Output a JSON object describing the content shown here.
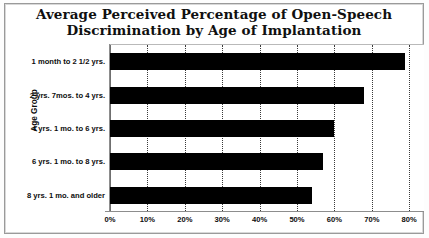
{
  "chart_data": {
    "type": "bar",
    "orientation": "horizontal",
    "title": "Average Perceived Percentage of Open-Speech Discrimination by Age of Implantation",
    "title_lines": [
      "Average Perceived Percentage of Open-Speech",
      "Discrimination by Age of Implantation"
    ],
    "categories": [
      "1 month to 2 1/2 yrs.",
      "2 yrs. 7mos. to 4 yrs.",
      "4 yrs. 1 mo. to 6 yrs.",
      "6 yrs. 1 mo. to 8 yrs.",
      "8 yrs. 1 mo. and older"
    ],
    "values": [
      79,
      68,
      60,
      57,
      54
    ],
    "xlabel": "",
    "ylabel": "Age Group",
    "xlim": [
      0,
      80
    ],
    "ylim": null,
    "xticks": [
      0,
      10,
      20,
      30,
      40,
      50,
      60,
      70,
      80
    ],
    "xtick_labels": [
      "0%",
      "10%",
      "20%",
      "30%",
      "40%",
      "50%",
      "60%",
      "70%",
      "80%"
    ],
    "grid": "vertical-dotted",
    "legend": null,
    "series": [
      {
        "name": "Average Perceived Percentage of Open-Speech Discrimination",
        "values": [
          79,
          68,
          60,
          57,
          54
        ],
        "color": "#000000"
      }
    ],
    "colors": {
      "bar": "#000000",
      "gridline": "#3a3a3a",
      "axis": "#8d8d8d",
      "frame": "#9a9a9a",
      "text": "#0d0d0d",
      "background": "#ffffff"
    }
  }
}
